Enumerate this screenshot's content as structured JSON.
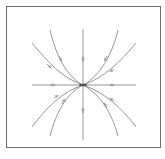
{
  "diagram": {
    "type": "phase-portrait",
    "kind": "stable-node",
    "frame_color": "#6e6e6e",
    "curve_color": "#8c8c8c",
    "origin": {
      "x": 83,
      "y": 85
    },
    "axes": {
      "horizontal": {
        "x1": 32,
        "x2": 136,
        "y": 85
      },
      "vertical": {
        "x": 83,
        "y1": 29,
        "y2": 140
      }
    },
    "trajectories": [
      {
        "name": "upper-left-outer",
        "start": [
          32,
          43
        ],
        "direction": "into-origin"
      },
      {
        "name": "upper-left-inner",
        "start": [
          50,
          30
        ],
        "direction": "into-origin"
      },
      {
        "name": "upper-right-inner",
        "start": [
          118,
          30
        ],
        "direction": "into-origin"
      },
      {
        "name": "upper-right-outer",
        "start": [
          136,
          43
        ],
        "direction": "into-origin"
      },
      {
        "name": "lower-left-outer",
        "start": [
          32,
          127
        ],
        "direction": "into-origin"
      },
      {
        "name": "lower-left-inner",
        "start": [
          50,
          136
        ],
        "direction": "into-origin"
      },
      {
        "name": "lower-right-inner",
        "start": [
          118,
          136
        ],
        "direction": "into-origin"
      },
      {
        "name": "lower-right-outer",
        "start": [
          136,
          127
        ],
        "direction": "into-origin"
      }
    ],
    "caption_fragments": [
      "·",
      "·"
    ]
  }
}
